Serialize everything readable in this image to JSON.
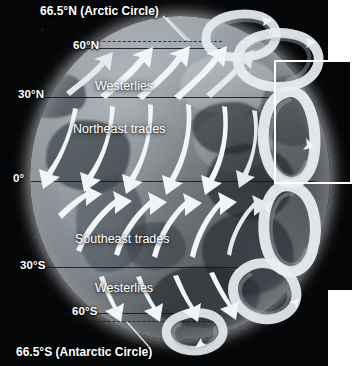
{
  "figure": {
    "background_color": "#050608",
    "globe_color": "#8b9299",
    "arrow_color": "#f2f5f8",
    "highlight_color": "#ffffff"
  },
  "labels": {
    "arctic_circle": "66.5°N (Arctic Circle)",
    "antarctic_circle": "66.5°S (Antarctic Circle)",
    "lat_60n": "60°N",
    "lat_30n": "30°N",
    "lat_0": "0°",
    "lat_30s": "30°S",
    "lat_60s": "60°S"
  },
  "wind_bands": [
    {
      "name": "Westerlies",
      "hemisphere": "north",
      "between": "30°N–60°N",
      "direction": "southwest-to-northeast"
    },
    {
      "name": "Northeast trades",
      "hemisphere": "north",
      "between": "0°–30°N",
      "direction": "northeast-to-southwest"
    },
    {
      "name": "Southeast trades",
      "hemisphere": "south",
      "between": "0°–30°S",
      "direction": "southeast-to-northwest"
    },
    {
      "name": "Westerlies",
      "hemisphere": "south",
      "between": "30°S–60°S",
      "direction": "northwest-to-southeast"
    }
  ],
  "band_label_text": {
    "north_westerlies": "Westerlies",
    "northeast_trades": "Northeast trades",
    "southeast_trades": "Southeast trades",
    "south_westerlies": "Westerlies"
  },
  "latitude_lines": [
    {
      "label": "66.5°N (Arctic Circle)",
      "style": "dashed"
    },
    {
      "label": "60°N",
      "style": "solid"
    },
    {
      "label": "30°N",
      "style": "solid"
    },
    {
      "label": "0°",
      "style": "solid"
    },
    {
      "label": "30°S",
      "style": "solid"
    },
    {
      "label": "60°S",
      "style": "solid"
    },
    {
      "label": "66.5°S (Antarctic Circle)",
      "style": "dashed"
    }
  ],
  "circulation_cells": [
    {
      "name": "polar-cell-north",
      "latitude_range": "60°N–90°N"
    },
    {
      "name": "ferrel-cell-north",
      "latitude_range": "30°N–60°N"
    },
    {
      "name": "hadley-cell-north",
      "latitude_range": "0°–30°N"
    },
    {
      "name": "hadley-cell-south",
      "latitude_range": "0°–30°S"
    },
    {
      "name": "ferrel-cell-south",
      "latitude_range": "30°S–60°S"
    },
    {
      "name": "polar-cell-south",
      "latitude_range": "60°S–90°S"
    }
  ]
}
